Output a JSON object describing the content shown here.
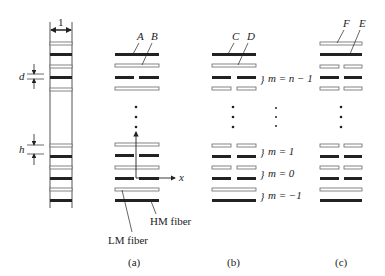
{
  "figure": {
    "left_stack": {
      "width_label": "1",
      "spacing_label_d": "d",
      "spacing_label_h": "h"
    },
    "panel_a": {
      "caption": "(a)",
      "fiber_labels": [
        "A",
        "B"
      ],
      "axis_label": "x",
      "hm_label": "HM fiber",
      "lm_label": "LM fiber"
    },
    "panel_b": {
      "caption": "(b)",
      "fiber_labels": [
        "C",
        "D"
      ],
      "layer_labels": [
        "m = n − 1",
        "m = 1",
        "m = 0",
        "m = −1"
      ]
    },
    "panel_c": {
      "caption": "(c)",
      "fiber_labels": [
        "F",
        "E"
      ]
    }
  }
}
